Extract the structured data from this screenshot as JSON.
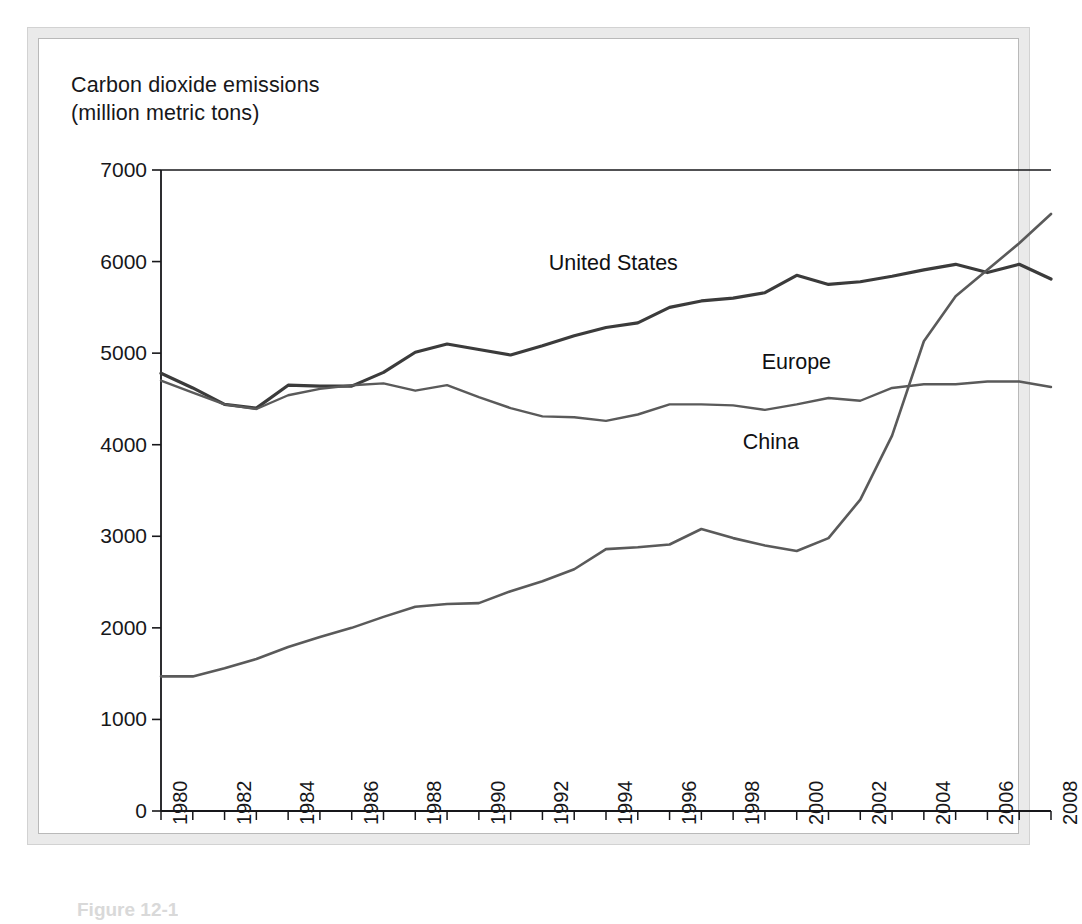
{
  "figure": {
    "axis_title_line1": "Carbon dioxide emissions",
    "axis_title_line2": "(million metric tons)",
    "caption": "Figure 12-1"
  },
  "chart_data": {
    "type": "line",
    "title": "Carbon dioxide emissions (million metric tons)",
    "xlabel": "",
    "ylabel": "Carbon dioxide emissions (million metric tons)",
    "xlim": [
      1980,
      2008
    ],
    "ylim": [
      0,
      7000
    ],
    "grid": false,
    "legend_position": "inline-annotations",
    "ytick_labels": [
      "0",
      "1000",
      "2000",
      "3000",
      "4000",
      "5000",
      "6000",
      "7000"
    ],
    "ytick_values": [
      0,
      1000,
      2000,
      3000,
      4000,
      5000,
      6000,
      7000
    ],
    "xtick_labels": [
      "1980",
      "1982",
      "1984",
      "1986",
      "1988",
      "1990",
      "1992",
      "1994",
      "1996",
      "1998",
      "2000",
      "2002",
      "2004",
      "2006",
      "2008"
    ],
    "xtick_values": [
      1980,
      1982,
      1984,
      1986,
      1988,
      1990,
      1992,
      1994,
      1996,
      1998,
      2000,
      2002,
      2004,
      2006,
      2008
    ],
    "x": [
      1980,
      1981,
      1982,
      1983,
      1984,
      1985,
      1986,
      1987,
      1988,
      1989,
      1990,
      1991,
      1992,
      1993,
      1994,
      1995,
      1996,
      1997,
      1998,
      1999,
      2000,
      2001,
      2002,
      2003,
      2004,
      2005,
      2006,
      2007,
      2008
    ],
    "series": [
      {
        "name": "United States",
        "color": "#3b3b3b",
        "width": 3.2,
        "values": [
          4780,
          4620,
          4440,
          4400,
          4650,
          4640,
          4640,
          4790,
          5010,
          5100,
          5040,
          4980,
          5080,
          5190,
          5280,
          5330,
          5500,
          5570,
          5600,
          5660,
          5850,
          5750,
          5780,
          5840,
          5910,
          5970,
          5880,
          5970,
          5810
        ]
      },
      {
        "name": "Europe",
        "color": "#5a5a5a",
        "width": 2.4,
        "values": [
          4700,
          4570,
          4440,
          4390,
          4540,
          4610,
          4650,
          4670,
          4590,
          4650,
          4520,
          4400,
          4310,
          4300,
          4260,
          4330,
          4440,
          4440,
          4430,
          4380,
          4440,
          4510,
          4480,
          4620,
          4660,
          4660,
          4690,
          4690,
          4630
        ]
      },
      {
        "name": "China",
        "color": "#5a5a5a",
        "width": 2.6,
        "values": [
          1470,
          1470,
          1560,
          1660,
          1790,
          1900,
          2000,
          2120,
          2230,
          2260,
          2270,
          2400,
          2510,
          2640,
          2860,
          2880,
          2910,
          3080,
          2980,
          2900,
          2840,
          2980,
          3400,
          4100,
          5130,
          5620,
          5910,
          6200,
          6520
        ]
      }
    ],
    "annotations": [
      {
        "text": "United States",
        "x": 1992.2,
        "y": 5980
      },
      {
        "text": "Europe",
        "x": 1998.9,
        "y": 4900
      },
      {
        "text": "China",
        "x": 1998.3,
        "y": 4030
      }
    ]
  }
}
